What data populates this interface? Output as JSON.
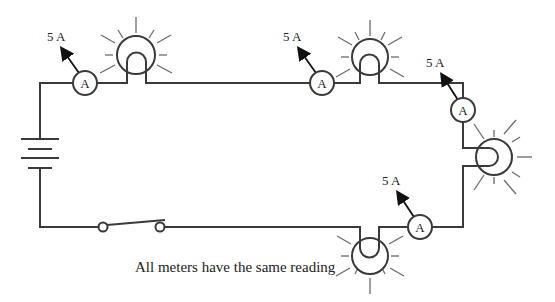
{
  "diagram": {
    "type": "series-circuit",
    "caption": "All meters have the same reading",
    "meter_letter": "A",
    "readings": {
      "meter1": "5 A",
      "meter2": "5 A",
      "meter3": "5 A",
      "meter4": "5 A"
    },
    "components": {
      "battery_count": 1,
      "switch_count": 1,
      "bulb_count": 4,
      "ammeter_count": 4
    },
    "colors": {
      "wire": "#3a3a3a",
      "rays": "#6a6a6a",
      "background": "#ffffff"
    }
  }
}
